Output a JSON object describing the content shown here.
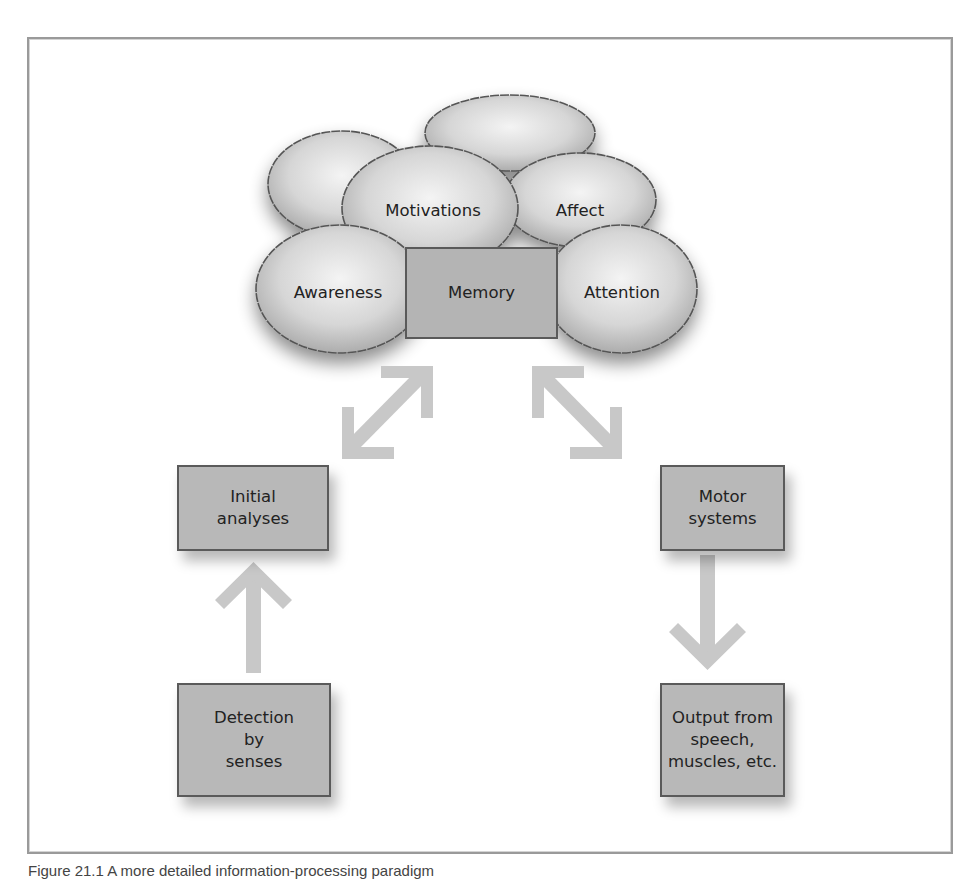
{
  "figure": {
    "caption": "Figure 21.1 A more detailed information-processing paradigm",
    "clouds": [
      {
        "id": "motivations",
        "label": "Motivations"
      },
      {
        "id": "affect",
        "label": "Affect"
      },
      {
        "id": "awareness",
        "label": "Awareness"
      },
      {
        "id": "attention",
        "label": "Attention"
      }
    ],
    "central_box": {
      "label": "Memory"
    },
    "boxes": {
      "initial_analyses": "Initial\nanalyses",
      "detection": "Detection\nby\nsenses",
      "motor_systems": "Motor\nsystems",
      "output": "Output from\nspeech,\nmuscles, etc."
    },
    "arrows": [
      {
        "from": "Detection by senses",
        "to": "Initial analyses",
        "type": "single"
      },
      {
        "from": "Initial analyses",
        "to": "Memory cluster",
        "type": "double"
      },
      {
        "from": "Memory cluster",
        "to": "Motor systems",
        "type": "double"
      },
      {
        "from": "Motor systems",
        "to": "Output from speech, muscles, etc.",
        "type": "single"
      }
    ],
    "colors": {
      "box_fill": "#b8b8b8",
      "box_border": "#5a5a5a",
      "arrow": "#c8c8c8",
      "cloud_center": "#f2f2f2",
      "cloud_edge": "#b0b0b0",
      "frame": "#9a9a9a"
    }
  }
}
